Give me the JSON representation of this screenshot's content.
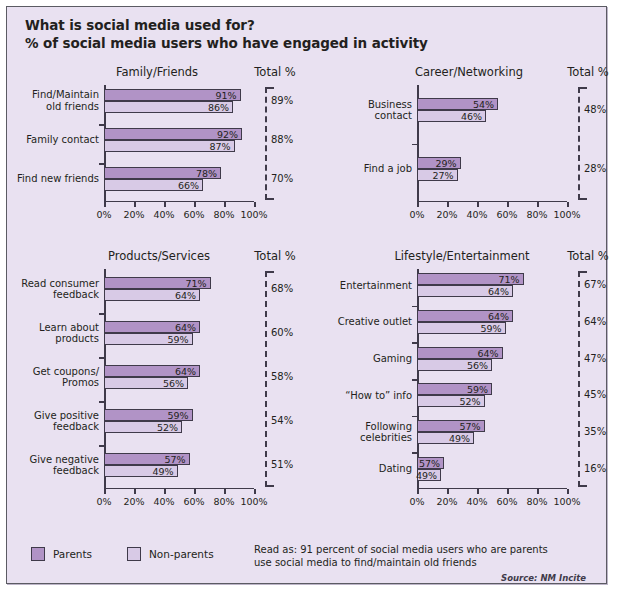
{
  "header": {
    "title": "What is social media used for?",
    "subtitle": "% of social media users who have engaged in activity"
  },
  "legend": {
    "parents_label": "Parents",
    "nonparents_label": "Non-parents"
  },
  "footer": {
    "read_as": "Read as: 91 percent of social media users who are parents use social media to find/maintain old friends",
    "source": "Source: NM Incite"
  },
  "total_header": "Total %",
  "axis": {
    "ticks": [
      "0%",
      "20%",
      "40%",
      "60%",
      "80%",
      "100%"
    ],
    "tick_values": [
      0,
      20,
      40,
      60,
      80,
      100
    ],
    "min": 0,
    "max": 100
  },
  "colors": {
    "parents": "#b193c6",
    "nonparents": "#d8cae6",
    "background": "#e9e1f1",
    "ink": "#231f20",
    "axis": "#3f3a4a"
  },
  "chart_data": {
    "type": "bar",
    "title": "What is social media used for?",
    "subtitle": "% of social media users who have engaged in activity",
    "xlabel": "",
    "ylabel": "",
    "xlim": [
      0,
      100
    ],
    "grid": false,
    "legend_position": "bottom-left",
    "orientation": "horizontal",
    "series_names": [
      "Parents",
      "Non-parents"
    ],
    "panels": [
      {
        "name": "Family/Friends",
        "categories": [
          "Find/Maintain old friends",
          "Family contact",
          "Find new friends"
        ],
        "category_lines": [
          [
            "Find/Maintain",
            "old friends"
          ],
          [
            "Family contact"
          ],
          [
            "Find new friends"
          ]
        ],
        "series": [
          {
            "name": "Parents",
            "values": [
              91,
              92,
              78
            ]
          },
          {
            "name": "Non-parents",
            "values": [
              86,
              87,
              66
            ]
          }
        ],
        "value_labels": [
          [
            "91%",
            "92%",
            "78%"
          ],
          [
            "86%",
            "87%",
            "66%"
          ]
        ],
        "totals": [
          "89%",
          "88%",
          "70%"
        ],
        "total_values": [
          89,
          88,
          70
        ]
      },
      {
        "name": "Career/Networking",
        "categories": [
          "Business contact",
          "Find a job"
        ],
        "category_lines": [
          [
            "Business",
            "contact"
          ],
          [
            "Find a job"
          ]
        ],
        "series": [
          {
            "name": "Parents",
            "values": [
              54,
              29
            ]
          },
          {
            "name": "Non-parents",
            "values": [
              46,
              27
            ]
          }
        ],
        "value_labels": [
          [
            "54%",
            "29%"
          ],
          [
            "46%",
            "27%"
          ]
        ],
        "totals": [
          "48%",
          "28%"
        ],
        "total_values": [
          48,
          28
        ]
      },
      {
        "name": "Products/Services",
        "categories": [
          "Read consumer feedback",
          "Learn about products",
          "Get coupons/Promos",
          "Give positive feedback",
          "Give negative feedback"
        ],
        "category_lines": [
          [
            "Read consumer",
            "feedback"
          ],
          [
            "Learn about",
            "products"
          ],
          [
            "Get coupons/",
            "Promos"
          ],
          [
            "Give positive",
            "feedback"
          ],
          [
            "Give negative",
            "feedback"
          ]
        ],
        "series": [
          {
            "name": "Parents",
            "values": [
              71,
              64,
              64,
              59,
              57
            ]
          },
          {
            "name": "Non-parents",
            "values": [
              64,
              59,
              56,
              52,
              49
            ]
          }
        ],
        "value_labels": [
          [
            "71%",
            "64%",
            "64%",
            "59%",
            "57%"
          ],
          [
            "64%",
            "59%",
            "56%",
            "52%",
            "49%"
          ]
        ],
        "totals": [
          "68%",
          "60%",
          "58%",
          "54%",
          "51%"
        ],
        "total_values": [
          68,
          60,
          58,
          54,
          51
        ]
      },
      {
        "name": "Lifestyle/Entertainment",
        "categories": [
          "Entertainment",
          "Creative outlet",
          "Gaming",
          "“How to” info",
          "Following celebrities",
          "Dating"
        ],
        "category_lines": [
          [
            "Entertainment"
          ],
          [
            "Creative outlet"
          ],
          [
            "Gaming"
          ],
          [
            "“How to” info"
          ],
          [
            "Following",
            "celebrities"
          ],
          [
            "Dating"
          ]
        ],
        "series": [
          {
            "name": "Parents",
            "values": [
              71,
              64,
              57,
              50,
              45,
              18
            ]
          },
          {
            "name": "Non-parents",
            "values": [
              64,
              59,
              50,
              45,
              38,
              16
            ]
          }
        ],
        "value_labels": [
          [
            "71%",
            "64%",
            "64%",
            "59%",
            "57%",
            "57%"
          ],
          [
            "64%",
            "59%",
            "56%",
            "52%",
            "49%",
            "49%"
          ]
        ],
        "totals": [
          "67%",
          "64%",
          "47%",
          "45%",
          "35%",
          "16%"
        ],
        "total_values": [
          67,
          64,
          47,
          45,
          35,
          16
        ]
      }
    ]
  }
}
